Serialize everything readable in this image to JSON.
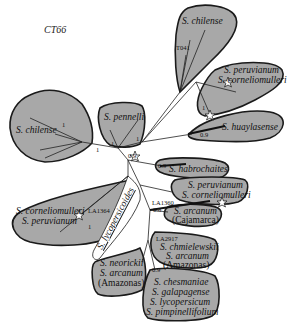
{
  "diagram": {
    "title": "CT66",
    "type": "unrooted phylogenetic tree",
    "clades": [
      {
        "id": "chilense-top",
        "labels": [
          "S. chilense"
        ],
        "node_labels": [
          "T041"
        ]
      },
      {
        "id": "peruvianum-corneliomulleri-top",
        "labels": [
          "S. peruvianum",
          "S. corneliomulleri"
        ],
        "support": [
          "1"
        ]
      },
      {
        "id": "huaylasense",
        "labels": [
          "S. huaylasense"
        ],
        "support": [
          "0.9"
        ]
      },
      {
        "id": "habrochaites",
        "labels": [
          "S. habrochaites"
        ],
        "support": [
          "0.9"
        ]
      },
      {
        "id": "peruvianum-corneliomulleri-right",
        "labels": [
          "S. peruvianum",
          "S. corneliomulleri"
        ]
      },
      {
        "id": "arcanum-cajamarca",
        "labels": [
          "S. arcanum",
          "(Cajamarca)"
        ],
        "node_labels": [
          "LA1360"
        ],
        "support": [
          "0.8"
        ]
      },
      {
        "id": "chmielewskii-arcanum-amazonas",
        "labels": [
          "S. chmielewskii",
          "S. arcanum",
          "(Amazonas)"
        ],
        "node_labels": [
          "LA2917"
        ]
      },
      {
        "id": "esculentum-group",
        "labels": [
          "S. chesmaniae",
          "S. galapagense",
          "S. lycopersicum",
          "S. pimpinellifolium"
        ],
        "support": [
          "0.9"
        ]
      },
      {
        "id": "neorickii-arcanum-amazonas",
        "labels": [
          "S. neorickii",
          "S. arcanum",
          "(Amazonas)"
        ]
      },
      {
        "id": "corneliomulleri-peruvianum-left",
        "labels": [
          "S. corneliomulleri",
          "S. peruvianum"
        ],
        "node_labels": [
          "LA1364"
        ],
        "support": [
          "1"
        ]
      },
      {
        "id": "chilense-left",
        "labels": [
          "S. chilense"
        ],
        "support": [
          "1",
          "1"
        ]
      },
      {
        "id": "pennellii",
        "labels": [
          "S. pennelli"
        ],
        "support": [
          "1",
          "1"
        ]
      }
    ],
    "group_label": "S. lycopersicoides",
    "center_support": [
      "0.9"
    ],
    "colors": {
      "clade_fill": "#a8a8a8",
      "clade_stroke": "#1a1a1a",
      "branch": "#222222",
      "background": "#ffffff"
    }
  }
}
